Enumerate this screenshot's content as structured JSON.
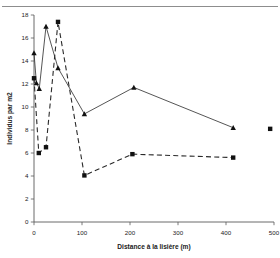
{
  "chart_data": {
    "type": "line",
    "title": "",
    "xlabel": "Distance à la lisière (m)",
    "ylabel": "Individus par m2",
    "xlim": [
      0,
      500
    ],
    "ylim": [
      0,
      18
    ],
    "xticks": [
      0,
      100,
      200,
      300,
      400,
      500
    ],
    "yticks": [
      0,
      2,
      4,
      6,
      8,
      10,
      12,
      14,
      16,
      18
    ],
    "xtick_labels": [
      "0",
      "100",
      "200",
      "300",
      "400",
      "500"
    ],
    "ytick_labels": [
      "0",
      "2",
      "4",
      "6",
      "8",
      "10",
      "12",
      "14",
      "16",
      "18"
    ],
    "grid": false,
    "legend": "none",
    "series": [
      {
        "name": "solid-triangles",
        "marker": "triangle",
        "linestyle": "solid",
        "color": "#111111",
        "points": [
          {
            "x": 0,
            "y": 14.7
          },
          {
            "x": 5,
            "y": 12.1
          },
          {
            "x": 11,
            "y": 11.6
          },
          {
            "x": 25,
            "y": 17.0
          },
          {
            "x": 50,
            "y": 13.4
          },
          {
            "x": 105,
            "y": 9.4
          },
          {
            "x": 208,
            "y": 11.7
          },
          {
            "x": 415,
            "y": 8.2
          }
        ]
      },
      {
        "name": "dashed-squares",
        "marker": "square",
        "linestyle": "dashed",
        "color": "#111111",
        "points": [
          {
            "x": 0,
            "y": 12.5
          },
          {
            "x": 10,
            "y": 6.0
          },
          {
            "x": 25,
            "y": 6.5
          },
          {
            "x": 50,
            "y": 17.4
          },
          {
            "x": 105,
            "y": 4.05
          },
          {
            "x": 205,
            "y": 5.9
          },
          {
            "x": 415,
            "y": 5.6
          }
        ]
      },
      {
        "name": "isolated-square",
        "marker": "square",
        "linestyle": "none",
        "color": "#111111",
        "points": [
          {
            "x": 492,
            "y": 8.1
          }
        ]
      }
    ]
  }
}
